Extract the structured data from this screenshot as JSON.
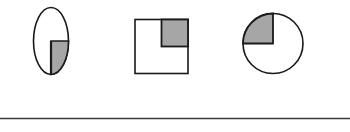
{
  "figure": {
    "colors": {
      "outline": "#1a1a1a",
      "shade": "#a6a6a6",
      "fill": "#ffffff",
      "rule": "#3a3a3a"
    },
    "shapes": [
      {
        "name": "ellipse",
        "shaded_fraction": "1/4",
        "shaded_quadrant": "bottom-right"
      },
      {
        "name": "square",
        "shaded_fraction": "1/4",
        "shaded_quadrant": "top-right"
      },
      {
        "name": "circle",
        "shaded_fraction": "1/4",
        "shaded_quadrant": "top-left"
      }
    ]
  }
}
